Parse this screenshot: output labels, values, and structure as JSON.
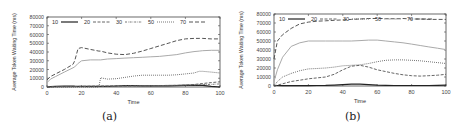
{
  "chart_data": [
    {
      "type": "line",
      "caption": "(a)",
      "xlabel": "Time",
      "ylabel": "Average Token Waiting Time (ms)",
      "xlim": [
        0,
        100
      ],
      "ylim": [
        0,
        80000
      ],
      "xticks": [
        "0",
        "20",
        "40",
        "60",
        "80",
        "100"
      ],
      "yticks": [
        "0",
        "10000",
        "20000",
        "30000",
        "40000",
        "50000",
        "60000",
        "70000",
        "80000"
      ],
      "grid": false,
      "legend_position": "top-inside",
      "legend": [
        "10",
        "20",
        "30",
        "50",
        "70"
      ],
      "x": [
        0,
        2,
        5,
        10,
        15,
        16,
        18,
        20,
        25,
        30,
        31,
        35,
        40,
        45,
        50,
        55,
        60,
        65,
        70,
        75,
        80,
        85,
        88,
        90,
        95,
        100
      ],
      "series": [
        {
          "name": "10",
          "style": "solid-dark",
          "values": [
            0,
            300,
            800,
            1200,
            1000,
            900,
            800,
            700,
            700,
            700,
            700,
            800,
            1200,
            1500,
            1500,
            1400,
            1300,
            1300,
            1400,
            1600,
            2000,
            2000,
            2000,
            1800,
            800,
            0
          ]
        },
        {
          "name": "20",
          "style": "dashed",
          "values": [
            0,
            200,
            300,
            500,
            600,
            600,
            700,
            800,
            900,
            1000,
            1000,
            1100,
            1200,
            1200,
            1300,
            1400,
            1500,
            1600,
            1800,
            2000,
            2300,
            2800,
            3500,
            4000,
            5000,
            6000
          ]
        },
        {
          "name": "30",
          "style": "dash-dot",
          "values": [
            0,
            200,
            300,
            400,
            500,
            500,
            600,
            600,
            700,
            800,
            800,
            900,
            1000,
            1100,
            1200,
            1300,
            1400,
            1600,
            1800,
            2000,
            2200,
            2400,
            2600,
            2800,
            3000,
            3500
          ]
        },
        {
          "name": "50",
          "style": "dotted",
          "values": [
            0,
            0,
            0,
            0,
            0,
            0,
            0,
            0,
            0,
            0,
            10500,
            9000,
            9500,
            11000,
            12500,
            13500,
            13500,
            13500,
            13500,
            14000,
            15000,
            16000,
            18000,
            18000,
            17000,
            16000
          ]
        },
        {
          "name": "70",
          "style": "solid-light",
          "values": [
            5000,
            9000,
            12000,
            17000,
            22000,
            23000,
            27000,
            30000,
            31000,
            31000,
            31000,
            32000,
            32500,
            33000,
            33500,
            34000,
            34500,
            35000,
            36000,
            37000,
            39000,
            40500,
            41000,
            41500,
            42000,
            42000
          ]
        },
        {
          "name": "70-dashed",
          "style": "long-dash",
          "values": [
            8000,
            12000,
            15000,
            20000,
            26000,
            30000,
            44000,
            45000,
            43000,
            41000,
            41000,
            39000,
            37500,
            37000,
            38500,
            41000,
            44000,
            47000,
            50000,
            53000,
            55000,
            55500,
            55500,
            55500,
            55000,
            55000
          ]
        }
      ]
    },
    {
      "type": "line",
      "caption": "(b)",
      "xlabel": "Time",
      "ylabel": "Average Token Waiting Time (ms)",
      "xlim": [
        0,
        100
      ],
      "ylim": [
        0,
        80000
      ],
      "xticks": [
        "0",
        "20",
        "40",
        "60",
        "80",
        "100"
      ],
      "yticks": [
        "0",
        "10000",
        "20000",
        "30000",
        "40000",
        "50000",
        "60000",
        "70000",
        "80000"
      ],
      "grid": false,
      "legend_position": "top-inside",
      "legend": [
        "10",
        "20",
        "30",
        "50",
        "70"
      ],
      "x": [
        0,
        2,
        5,
        10,
        15,
        20,
        25,
        30,
        35,
        40,
        45,
        50,
        55,
        60,
        65,
        70,
        75,
        80,
        85,
        90,
        95,
        100
      ],
      "series": [
        {
          "name": "10",
          "style": "solid-dark",
          "values": [
            500,
            500,
            400,
            400,
            400,
            400,
            500,
            700,
            1000,
            1500,
            2000,
            2000,
            1500,
            1000,
            800,
            600,
            500,
            500,
            500,
            600,
            800,
            1000
          ]
        },
        {
          "name": "20",
          "style": "dashed",
          "values": [
            0,
            1000,
            2500,
            5000,
            6500,
            8000,
            9000,
            10000,
            13000,
            18000,
            22000,
            23000,
            21000,
            18000,
            16000,
            14000,
            12500,
            11500,
            11000,
            11500,
            12000,
            13000
          ]
        },
        {
          "name": "30",
          "style": "dotted",
          "values": [
            0,
            5000,
            10000,
            14000,
            17000,
            19000,
            19500,
            20000,
            21000,
            22500,
            23000,
            23500,
            25000,
            27000,
            28500,
            29000,
            29000,
            28500,
            28000,
            27000,
            26000,
            25000
          ]
        },
        {
          "name": "50",
          "style": "solid-light",
          "values": [
            5000,
            18000,
            32000,
            44000,
            48000,
            50000,
            50000,
            50000,
            50000,
            50000,
            50000,
            50500,
            51000,
            51000,
            50000,
            49000,
            48000,
            46500,
            45000,
            43500,
            42000,
            40500
          ]
        },
        {
          "name": "70",
          "style": "long-dash",
          "values": [
            30000,
            50000,
            57000,
            64000,
            69000,
            71000,
            72000,
            72500,
            73000,
            73500,
            74000,
            74500,
            75000,
            75000,
            75000,
            75000,
            75000,
            74500,
            74500,
            74000,
            74000,
            74000
          ]
        }
      ]
    }
  ]
}
